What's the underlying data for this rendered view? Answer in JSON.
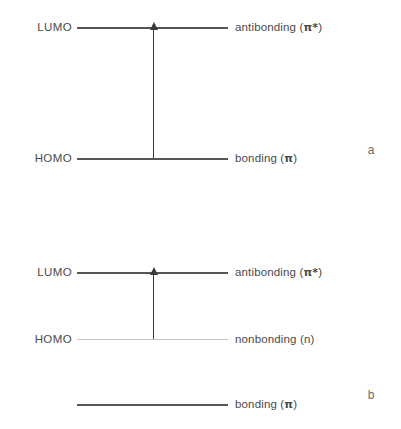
{
  "figure": {
    "background_color": "#ffffff",
    "line_color": "#555555",
    "faint_line_color": "#c4c4c4",
    "arrow_color": "#3a3a3a",
    "text_color": "#4a4a4a"
  },
  "panels": [
    {
      "letter": "a",
      "transition": "pi to pi*",
      "state_labels": [
        {
          "text": "LUMO"
        },
        {
          "text": "HOMO"
        }
      ],
      "orbital_labels": [
        {
          "prefix": "antibonding (",
          "symbol": "π*",
          "suffix": ")"
        },
        {
          "prefix": "bonding (",
          "symbol": "π",
          "suffix": ")"
        }
      ]
    },
    {
      "letter": "b",
      "transition": "n to pi*",
      "state_labels": [
        {
          "text": "LUMO"
        },
        {
          "text": "HOMO"
        }
      ],
      "orbital_labels": [
        {
          "prefix": "antibonding (",
          "symbol": "π*",
          "suffix": ")"
        },
        {
          "prefix": "nonbonding (",
          "symbol": "n",
          "suffix": ")"
        },
        {
          "prefix": "bonding (",
          "symbol": "π",
          "suffix": ")"
        }
      ]
    }
  ]
}
